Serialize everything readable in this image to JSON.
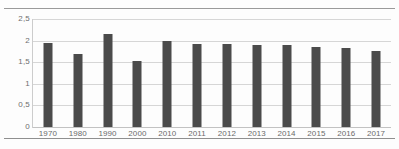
{
  "chart_data": {
    "type": "bar",
    "title": "",
    "subtitle": "",
    "xlabel": "",
    "ylabel": "",
    "categories": [
      "1970",
      "1980",
      "1990",
      "2000",
      "2010",
      "2011",
      "2012",
      "2013",
      "2014",
      "2015",
      "2016",
      "2017"
    ],
    "values": [
      1.95,
      1.7,
      2.15,
      1.53,
      2.0,
      1.92,
      1.92,
      1.9,
      1.9,
      1.86,
      1.83,
      1.75
    ],
    "series": [
      {
        "name": "",
        "values": [
          1.95,
          1.7,
          2.15,
          1.53,
          2.0,
          1.92,
          1.92,
          1.9,
          1.9,
          1.86,
          1.83,
          1.75
        ]
      }
    ],
    "ylim": [
      0,
      2.5
    ],
    "y_ticks": [
      0,
      0.5,
      1,
      1.5,
      2,
      2.5
    ],
    "y_tick_labels": [
      "0",
      "0,5",
      "1",
      "1,5",
      "2",
      "2,5"
    ],
    "grid": true,
    "legend": false,
    "legend_position": "none",
    "bar_color": "#4b4b4b",
    "gridline_color": "#d6d6d6",
    "background_color": "#fdfdfd",
    "decimal_separator": ","
  }
}
